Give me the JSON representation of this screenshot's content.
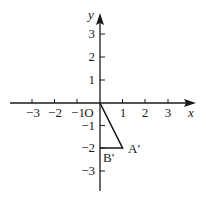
{
  "diagram": {
    "type": "coordinate-plane",
    "axes": {
      "x_label": "x",
      "y_label": "y",
      "origin_label": "O",
      "x_ticks": [
        {
          "value": -3,
          "label": "−3"
        },
        {
          "value": -2,
          "label": "−2"
        },
        {
          "value": -1,
          "label": "−1"
        },
        {
          "value": 1,
          "label": "1"
        },
        {
          "value": 2,
          "label": "2"
        },
        {
          "value": 3,
          "label": "3"
        }
      ],
      "y_ticks": [
        {
          "value": 3,
          "label": "3"
        },
        {
          "value": 2,
          "label": "2"
        },
        {
          "value": 1,
          "label": "1"
        },
        {
          "value": -1,
          "label": "−1"
        },
        {
          "value": -2,
          "label": "−2"
        },
        {
          "value": -3,
          "label": "−3"
        }
      ]
    },
    "triangle": {
      "vertices": [
        {
          "name": "O",
          "x": 0,
          "y": 0
        },
        {
          "name": "A′",
          "x": 1,
          "y": -2
        },
        {
          "name": "B′",
          "x": 0,
          "y": -2
        }
      ],
      "labels": {
        "A": "A′",
        "B": "B′"
      }
    },
    "colors": {
      "stroke": "#1a1a1a",
      "background": "#ffffff"
    }
  }
}
